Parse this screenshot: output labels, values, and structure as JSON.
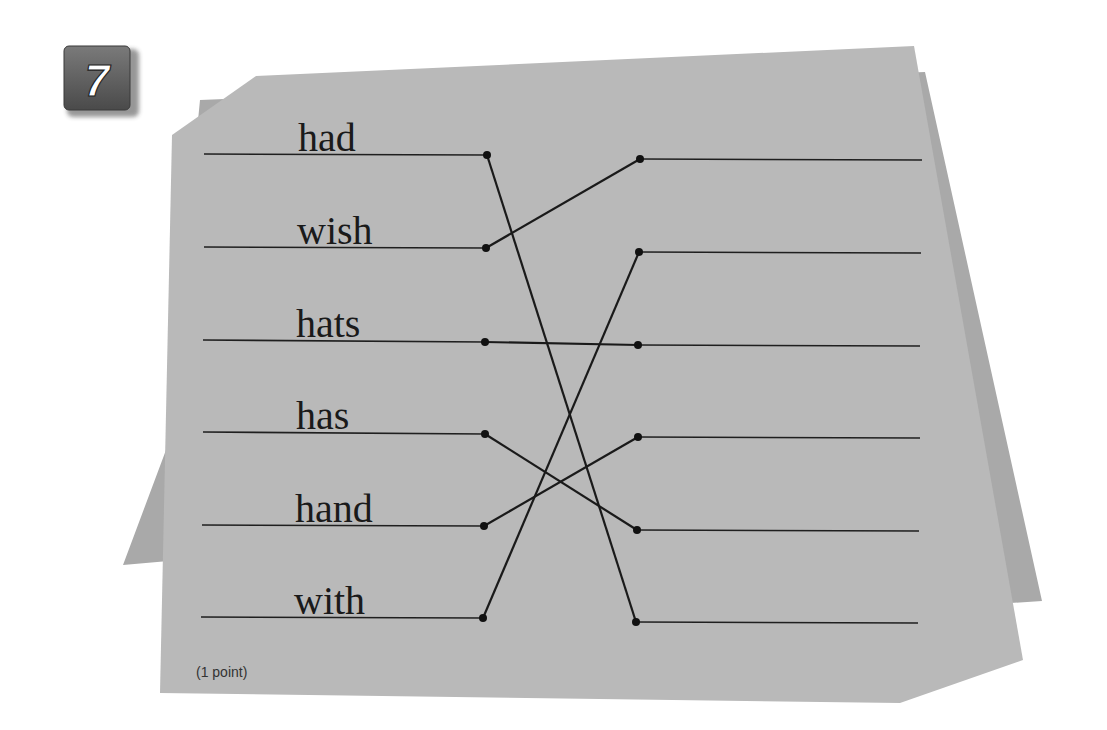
{
  "exercise": {
    "number": "7",
    "points_label": "(1 point)",
    "colors": {
      "paper_front": "#b9b9b9",
      "paper_back": "#a8a8a8",
      "ink": "#1a1a1a",
      "badge": "#5f5f5f"
    },
    "left_items": [
      {
        "label": "had",
        "line_y": 154,
        "dot": [
          487,
          155
        ]
      },
      {
        "label": "wish",
        "line_y": 247,
        "dot": [
          486,
          248
        ]
      },
      {
        "label": "hats",
        "line_y": 340,
        "dot": [
          485,
          342
        ]
      },
      {
        "label": "has",
        "line_y": 432,
        "dot": [
          485,
          434
        ]
      },
      {
        "label": "hand",
        "line_y": 525,
        "dot": [
          484,
          526
        ]
      },
      {
        "label": "with",
        "line_y": 617,
        "dot": [
          483,
          618
        ]
      }
    ],
    "right_items": [
      {
        "label": "",
        "line_y": 159,
        "dot": [
          640,
          159
        ]
      },
      {
        "label": "",
        "line_y": 252,
        "dot": [
          639,
          252
        ]
      },
      {
        "label": "",
        "line_y": 345,
        "dot": [
          638,
          345
        ]
      },
      {
        "label": "",
        "line_y": 437,
        "dot": [
          638,
          437
        ]
      },
      {
        "label": "",
        "line_y": 530,
        "dot": [
          637,
          530
        ]
      },
      {
        "label": "",
        "line_y": 622,
        "dot": [
          636,
          622
        ]
      }
    ],
    "connections": [
      {
        "from": "had",
        "to_index": 6
      },
      {
        "from": "wish",
        "to_index": 1
      },
      {
        "from": "hats",
        "to_index": 3
      },
      {
        "from": "has",
        "to_index": 5
      },
      {
        "from": "hand",
        "to_index": 4
      },
      {
        "from": "with",
        "to_index": 2
      }
    ]
  }
}
